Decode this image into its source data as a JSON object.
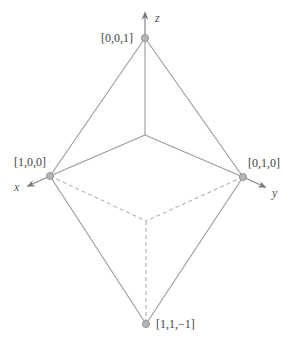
{
  "diagram": {
    "colors": {
      "edge": "#9a9a9a",
      "axis": "#777777",
      "vertex_fill": "#b5b5b5",
      "vertex_stroke": "#8c8c8c",
      "text": "#444444"
    },
    "axes": [
      {
        "name": "x",
        "label": "x"
      },
      {
        "name": "y",
        "label": "y"
      },
      {
        "name": "z",
        "label": "z"
      }
    ],
    "vertices": [
      {
        "id": "top",
        "label": "[0,0,1]"
      },
      {
        "id": "left",
        "label": "[1,0,0]"
      },
      {
        "id": "right",
        "label": "[0,1,0]"
      },
      {
        "id": "bottom",
        "label": "[1,1,−1]"
      }
    ],
    "edges": {
      "solid": [
        "top-left",
        "top-right",
        "left-bottom",
        "right-bottom",
        "origin-top",
        "origin-left",
        "origin-right"
      ],
      "dashed": [
        "left-center",
        "right-center",
        "center-bottom"
      ]
    }
  }
}
